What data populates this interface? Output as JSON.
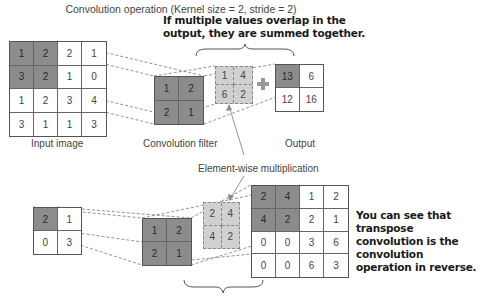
{
  "title": "Convolution operation (Kernel size = 2, stride = 2)",
  "top_note": {
    "line1": "If multiple values overlap in the",
    "line2": "output, they are summed together."
  },
  "bottom_note": {
    "line1": "You can see that transpose",
    "line2": "convolution is the convolution",
    "line3": "operation in reverse."
  },
  "labels": {
    "input_image": "Input image",
    "convolution_filter": "Convolution filter",
    "output": "Output",
    "element_wise": "Element-wise multiplication"
  },
  "convolution": {
    "input": [
      [
        "1",
        "2",
        "2",
        "1"
      ],
      [
        "3",
        "2",
        "1",
        "0"
      ],
      [
        "1",
        "2",
        "3",
        "4"
      ],
      [
        "3",
        "1",
        "1",
        "3"
      ]
    ],
    "filter": [
      [
        "1",
        "2"
      ],
      [
        "2",
        "1"
      ]
    ],
    "elementwise": [
      [
        "1",
        "4"
      ],
      [
        "6",
        "2"
      ]
    ],
    "output": [
      [
        "13",
        "6"
      ],
      [
        "12",
        "16"
      ]
    ]
  },
  "transpose": {
    "input": [
      [
        "2",
        "1"
      ],
      [
        "0",
        "3"
      ]
    ],
    "filter": [
      [
        "1",
        "2"
      ],
      [
        "2",
        "1"
      ]
    ],
    "elementwise": [
      [
        "2",
        "4"
      ],
      [
        "4",
        "2"
      ]
    ],
    "output": [
      [
        "2",
        "4",
        "1",
        "2"
      ],
      [
        "4",
        "2",
        "2",
        "1"
      ],
      [
        "0",
        "0",
        "3",
        "6"
      ],
      [
        "0",
        "0",
        "6",
        "3"
      ]
    ]
  },
  "icons": {
    "plus": "plus-icon"
  },
  "colors": {
    "dark_cell": "#8c8c8c",
    "dashed_cell": "#d0d0d0",
    "plus": "#999999"
  }
}
